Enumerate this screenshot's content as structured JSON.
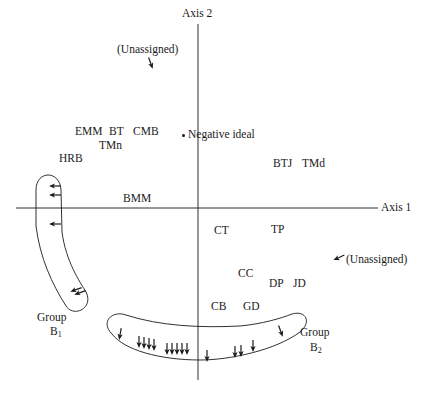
{
  "diagram": {
    "type": "perceptual-map",
    "axes": {
      "horizontal": {
        "label": "Axis 1",
        "y": 208,
        "x_from": 16,
        "x_to": 378,
        "label_x": 381,
        "label_y": 202
      },
      "vertical": {
        "label": "Axis 2",
        "x": 198,
        "y_from": 24,
        "y_to": 380,
        "label_x": 182,
        "label_y": 8
      }
    },
    "colors": {
      "ink": "#1a1a1a",
      "background": "#ffffff"
    },
    "negative_ideal": {
      "label": "Negative ideal",
      "dot_x": 183,
      "dot_y": 135,
      "label_x": 188,
      "label_y": 129
    },
    "stimuli": [
      {
        "label": "EMM",
        "x": 75,
        "y": 126
      },
      {
        "label": "BT",
        "x": 109,
        "y": 126
      },
      {
        "label": "CMB",
        "x": 133,
        "y": 126
      },
      {
        "label": "TMn",
        "x": 99,
        "y": 140
      },
      {
        "label": "HRB",
        "x": 59,
        "y": 153
      },
      {
        "label": "BMM",
        "x": 123,
        "y": 193
      },
      {
        "label": "BTJ",
        "x": 273,
        "y": 158
      },
      {
        "label": "TMd",
        "x": 302,
        "y": 158
      },
      {
        "label": "CT",
        "x": 214,
        "y": 225
      },
      {
        "label": "TP",
        "x": 271,
        "y": 224
      },
      {
        "label": "CC",
        "x": 238,
        "y": 268
      },
      {
        "label": "DP",
        "x": 269,
        "y": 278
      },
      {
        "label": "JD",
        "x": 293,
        "y": 278
      },
      {
        "label": "CB",
        "x": 211,
        "y": 301
      },
      {
        "label": "GD",
        "x": 243,
        "y": 301
      }
    ],
    "unassigned": [
      {
        "label": "(Unassigned)",
        "label_x": 117,
        "label_y": 44,
        "arrow_x": 151,
        "arrow_y": 64,
        "arrow_angle": 160
      },
      {
        "label": "(Unassigned)",
        "label_x": 346,
        "label_y": 254,
        "arrow_x": 338,
        "arrow_y": 258,
        "arrow_angle": 245
      }
    ],
    "groups": [
      {
        "name": "Group",
        "subscript_letter": "B",
        "subscript": "1",
        "label_x": 37,
        "label_y": 312,
        "sub_x": 50,
        "sub_y": 326,
        "outline_path": "M 36 190 C 36 170, 60 170, 61 190 L 62 232 C 66 262, 80 282, 86 292 C 94 308, 74 318, 66 306 C 52 284, 40 258, 36 226 Z",
        "arrows": [
          {
            "x": 54,
            "y": 186,
            "angle": 270
          },
          {
            "x": 54,
            "y": 195,
            "angle": 270
          },
          {
            "x": 54,
            "y": 224,
            "angle": 270
          },
          {
            "x": 75,
            "y": 290,
            "angle": 250
          },
          {
            "x": 79,
            "y": 293,
            "angle": 250
          }
        ]
      },
      {
        "name": "Group",
        "subscript_letter": "B",
        "subscript": "2",
        "label_x": 300,
        "label_y": 327,
        "sub_x": 310,
        "sub_y": 342,
        "outline_path": "M 112 334 C 100 322, 112 310, 126 315 C 160 326, 200 328, 240 326 C 262 324, 282 318, 292 314 C 306 310, 312 322, 300 332 C 276 350, 230 360, 200 360 C 160 360, 124 350, 112 334 Z",
        "arrows": [
          {
            "x": 120,
            "y": 335,
            "angle": 190
          },
          {
            "x": 139,
            "y": 343,
            "angle": 180
          },
          {
            "x": 144,
            "y": 344,
            "angle": 180
          },
          {
            "x": 149,
            "y": 345,
            "angle": 180
          },
          {
            "x": 154,
            "y": 346,
            "angle": 180
          },
          {
            "x": 167,
            "y": 350,
            "angle": 180
          },
          {
            "x": 172,
            "y": 350,
            "angle": 180
          },
          {
            "x": 177,
            "y": 350,
            "angle": 180
          },
          {
            "x": 182,
            "y": 350,
            "angle": 180
          },
          {
            "x": 187,
            "y": 350,
            "angle": 180
          },
          {
            "x": 207,
            "y": 357,
            "angle": 180
          },
          {
            "x": 235,
            "y": 353,
            "angle": 180
          },
          {
            "x": 241,
            "y": 352,
            "angle": 180
          },
          {
            "x": 253,
            "y": 347,
            "angle": 180
          },
          {
            "x": 281,
            "y": 332,
            "angle": 160
          }
        ]
      }
    ]
  }
}
